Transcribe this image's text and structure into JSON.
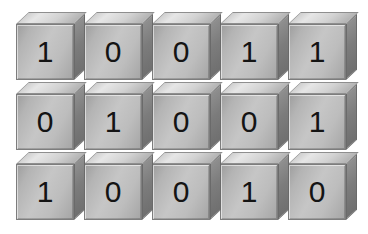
{
  "diagram": {
    "type": "isometric-cube-grid",
    "columns": 5,
    "rows": 3,
    "background_color": "#ffffff",
    "cube_front_color": "#bdbdbd",
    "cube_top_color": "#dcdcdc",
    "cube_side_color": "#7c7c7c",
    "digit_color": "#141414"
  },
  "grid": {
    "rows": [
      {
        "row_label": "row-1",
        "cells": [
          "1",
          "0",
          "0",
          "1",
          "1"
        ]
      },
      {
        "row_label": "row-2",
        "cells": [
          "0",
          "1",
          "0",
          "0",
          "1"
        ]
      },
      {
        "row_label": "row-3",
        "cells": [
          "1",
          "0",
          "0",
          "1",
          "0"
        ]
      }
    ]
  }
}
